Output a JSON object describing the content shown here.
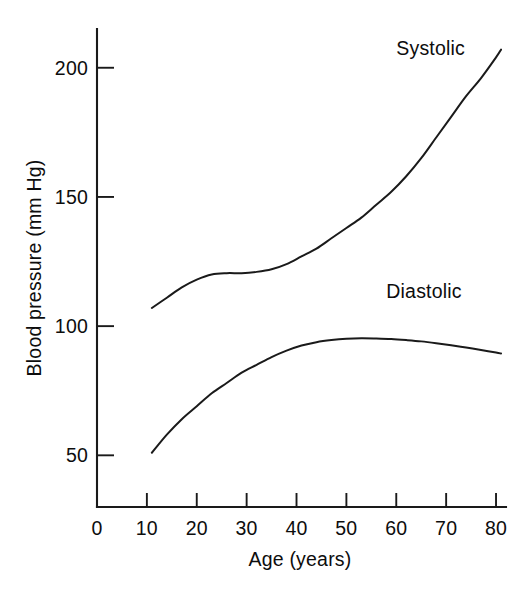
{
  "chart_data": {
    "type": "line",
    "title": "",
    "xlabel": "Age (years)",
    "ylabel": "Blood pressure (mm Hg)",
    "xlim": [
      0,
      82
    ],
    "ylim": [
      30,
      215
    ],
    "grid": false,
    "legend_position": "inline-labels",
    "x_ticks": [
      0,
      10,
      20,
      30,
      40,
      50,
      60,
      70,
      80
    ],
    "x_tick_labels": [
      "0",
      "10",
      "20",
      "30",
      "40",
      "50",
      "60",
      "70",
      "80"
    ],
    "y_ticks": [
      50,
      100,
      150,
      200
    ],
    "y_tick_labels": [
      "50",
      "100",
      "150",
      "200"
    ],
    "tick_direction": "in",
    "series": [
      {
        "name": "Systolic",
        "label_text": "Systolic",
        "color": "#1a1a1a",
        "x": [
          11,
          14,
          17,
          20,
          23,
          26,
          29,
          32,
          35,
          38,
          41,
          44,
          47,
          50,
          53,
          56,
          59,
          62,
          65,
          68,
          71,
          74,
          77,
          80,
          81
        ],
        "values": [
          107,
          111,
          115,
          118,
          120,
          120.5,
          120.5,
          121,
          122,
          124,
          127,
          130,
          134,
          138,
          142,
          147,
          152,
          158,
          165,
          173,
          181,
          189,
          196,
          204,
          207
        ]
      },
      {
        "name": "Diastolic",
        "label_text": "Diastolic",
        "color": "#1a1a1a",
        "x": [
          11,
          14,
          17,
          20,
          23,
          26,
          29,
          32,
          35,
          38,
          41,
          44,
          47,
          50,
          53,
          56,
          59,
          62,
          65,
          68,
          71,
          74,
          77,
          80,
          81
        ],
        "values": [
          51,
          58,
          64,
          69,
          74,
          78,
          82,
          85,
          88,
          90.5,
          92.5,
          93.8,
          94.6,
          95.1,
          95.3,
          95.2,
          95,
          94.6,
          94.1,
          93.4,
          92.6,
          91.7,
          90.8,
          89.8,
          89.4
        ]
      }
    ],
    "annotations": [
      {
        "text": "Systolic",
        "x": 60,
        "y": 205
      },
      {
        "text": "Diastolic",
        "x": 58,
        "y": 111
      }
    ]
  }
}
